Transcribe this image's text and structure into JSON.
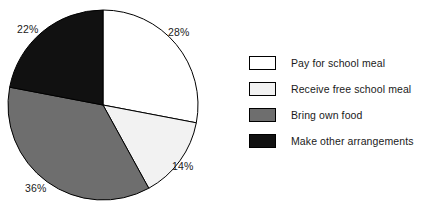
{
  "chart_data": {
    "type": "pie",
    "title": "",
    "xlabel": "",
    "ylabel": "",
    "legend_position": "right",
    "grid": false,
    "start_angle_deg": 0,
    "direction": "clockwise",
    "categories": [
      "Pay for school meal",
      "Receive free school meal",
      "Bring own food",
      "Make other arrangements"
    ],
    "values": [
      28,
      14,
      36,
      22
    ],
    "value_suffix": "%",
    "slices": [
      {
        "label": "Pay for school meal",
        "value": 28,
        "display": "28%",
        "color": "#ffffff",
        "stroke": "#000000",
        "label_x": 168,
        "label_y": 26
      },
      {
        "label": "Receive free school meal",
        "value": 14,
        "display": "14%",
        "color": "#f2f2f2",
        "stroke": "#000000",
        "label_x": 172,
        "label_y": 160
      },
      {
        "label": "Bring own food",
        "value": 36,
        "display": "36%",
        "color": "#6e6e6e",
        "stroke": "#000000",
        "label_x": 25,
        "label_y": 182
      },
      {
        "label": "Make other arrangements",
        "value": 22,
        "display": "22%",
        "color": "#111111",
        "stroke": "#000000",
        "label_x": 17,
        "label_y": 23
      }
    ],
    "geometry": {
      "cx": 103,
      "cy": 105,
      "r": 95
    }
  },
  "legend": {
    "items": [
      {
        "label": "Pay for school meal",
        "color": "#ffffff"
      },
      {
        "label": "Receive free school meal",
        "color": "#f2f2f2"
      },
      {
        "label": "Bring own food",
        "color": "#6e6e6e"
      },
      {
        "label": "Make other arrangements",
        "color": "#111111"
      }
    ]
  }
}
